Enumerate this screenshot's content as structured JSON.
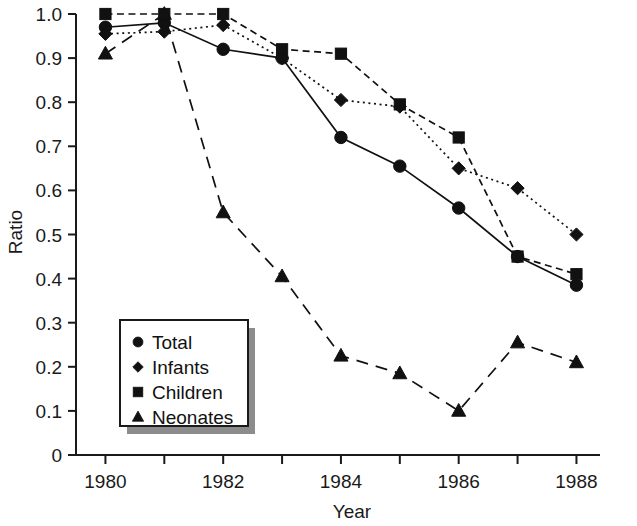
{
  "chart_data": {
    "type": "line",
    "title": "",
    "xlabel": "Year",
    "ylabel": "Ratio",
    "x": [
      1980,
      1981,
      1982,
      1983,
      1984,
      1985,
      1986,
      1987,
      1988
    ],
    "xlim": [
      1979.5,
      1988.4
    ],
    "ylim": [
      0,
      1.0
    ],
    "xticks": [
      1980,
      1981,
      1982,
      1983,
      1984,
      1985,
      1986,
      1987,
      1988
    ],
    "xticklabels": [
      "1980",
      "",
      "1982",
      "",
      "1984",
      "",
      "1986",
      "",
      "1988"
    ],
    "yticks": [
      0,
      0.1,
      0.2,
      0.3,
      0.4,
      0.5,
      0.6,
      0.7,
      0.8,
      0.9,
      1.0
    ],
    "yticklabels": [
      "0",
      "0.1",
      "0.2",
      "0.3",
      "0.4",
      "0.5",
      "0.6",
      "0.7",
      "0.8",
      "0.9",
      "1.0"
    ],
    "grid": false,
    "legend_position": "lower-left-inset",
    "series": [
      {
        "name": "Total",
        "marker": "circle",
        "linestyle": "solid",
        "color": "#111111",
        "x": [
          1980,
          1981,
          1982,
          1983,
          1984,
          1985,
          1986,
          1987,
          1988
        ],
        "values": [
          0.97,
          0.98,
          0.92,
          0.9,
          0.72,
          0.655,
          0.56,
          0.45,
          0.385
        ]
      },
      {
        "name": "Infants",
        "marker": "diamond",
        "linestyle": "dotted",
        "color": "#111111",
        "x": [
          1980,
          1981,
          1982,
          1983,
          1984,
          1985,
          1986,
          1987,
          1988
        ],
        "values": [
          0.955,
          0.96,
          0.975,
          0.9,
          0.805,
          0.79,
          0.65,
          0.605,
          0.5
        ]
      },
      {
        "name": "Children",
        "marker": "square",
        "linestyle": "dashed",
        "color": "#111111",
        "x": [
          1980,
          1981,
          1982,
          1983,
          1984,
          1985,
          1986,
          1987,
          1988
        ],
        "values": [
          1.0,
          1.0,
          1.0,
          0.92,
          0.91,
          0.795,
          0.72,
          0.45,
          0.41
        ]
      },
      {
        "name": "Neonates",
        "marker": "triangle",
        "linestyle": "longdash",
        "color": "#111111",
        "x": [
          1980,
          1981,
          1982,
          1983,
          1984,
          1985,
          1986,
          1987,
          1988
        ],
        "values": [
          0.91,
          1.0,
          0.55,
          0.405,
          0.225,
          0.185,
          0.1,
          0.255,
          0.21
        ]
      }
    ]
  },
  "legend": {
    "items": [
      {
        "label": "Total",
        "marker": "circle"
      },
      {
        "label": "Infants",
        "marker": "diamond"
      },
      {
        "label": "Children",
        "marker": "square"
      },
      {
        "label": "Neonates",
        "marker": "triangle"
      }
    ]
  },
  "axes": {
    "y_title": "Ratio",
    "x_title": "Year"
  }
}
